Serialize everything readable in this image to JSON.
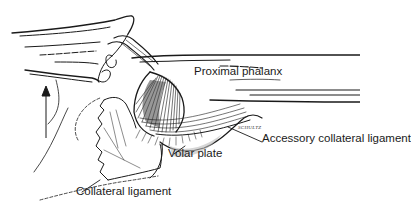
{
  "figure": {
    "labels": {
      "proximal_phalanx": "Proximal phalanx",
      "accessory_collateral_ligament": "Accessory collateral ligament",
      "volar_plate": "Volar plate",
      "collateral_ligament": "Collateral ligament"
    },
    "artist_signature": "SCHULTZ",
    "colors": {
      "ink": "#1a1a1a",
      "shading": "#555555",
      "background": "#ffffff"
    }
  }
}
